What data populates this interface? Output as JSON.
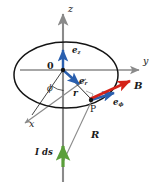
{
  "figure": {
    "width": 161,
    "height": 191,
    "background": "#ffffff"
  },
  "colors": {
    "axis": "#8a8a8a",
    "loop": "#141414",
    "unit_vector": "#2a5fae",
    "field_vector": "#d42218",
    "current_vector": "#5a9e3a",
    "ray": "#8a8a8a",
    "text": "#1a1a1a"
  },
  "axes": [
    {
      "id": "z",
      "label": "z",
      "sub": "",
      "direction": "up",
      "x": 68,
      "y": 4
    },
    {
      "id": "y",
      "label": "y",
      "sub": "",
      "direction": "right",
      "x": 143,
      "y": 56
    },
    {
      "id": "x",
      "label": "x",
      "sub": "",
      "direction": "down-left",
      "x": 29,
      "y": 122
    }
  ],
  "origin": {
    "label": "0",
    "x": 47,
    "y": 63,
    "point_x": 63,
    "point_y": 70
  },
  "angle": {
    "label": "ϕ",
    "name": "phi",
    "x": 47,
    "y": 88
  },
  "vectors": [
    {
      "id": "e_z",
      "label": "e",
      "sub": "z",
      "color": "unit_vector",
      "x": 72,
      "y": 48
    },
    {
      "id": "e_r",
      "label": "e",
      "sub": "r",
      "color": "unit_vector",
      "x": 78,
      "y": 78
    },
    {
      "id": "e_phi",
      "label": "e",
      "sub": "ϕ",
      "color": "unit_vector",
      "x": 113,
      "y": 100
    },
    {
      "id": "B",
      "label": "B",
      "sub": "",
      "color": "field_vector",
      "x": 134,
      "y": 84
    }
  ],
  "scalars": [
    {
      "id": "r",
      "label": "r",
      "x": 73,
      "y": 92
    },
    {
      "id": "R",
      "label": "R",
      "x": 91,
      "y": 133
    }
  ],
  "points": [
    {
      "id": "P",
      "label": "P",
      "x": 92,
      "y": 108
    }
  ],
  "source": {
    "id": "I_ds",
    "label": "I ds",
    "x": 35,
    "y": 152,
    "arrow_color": "current_vector"
  }
}
